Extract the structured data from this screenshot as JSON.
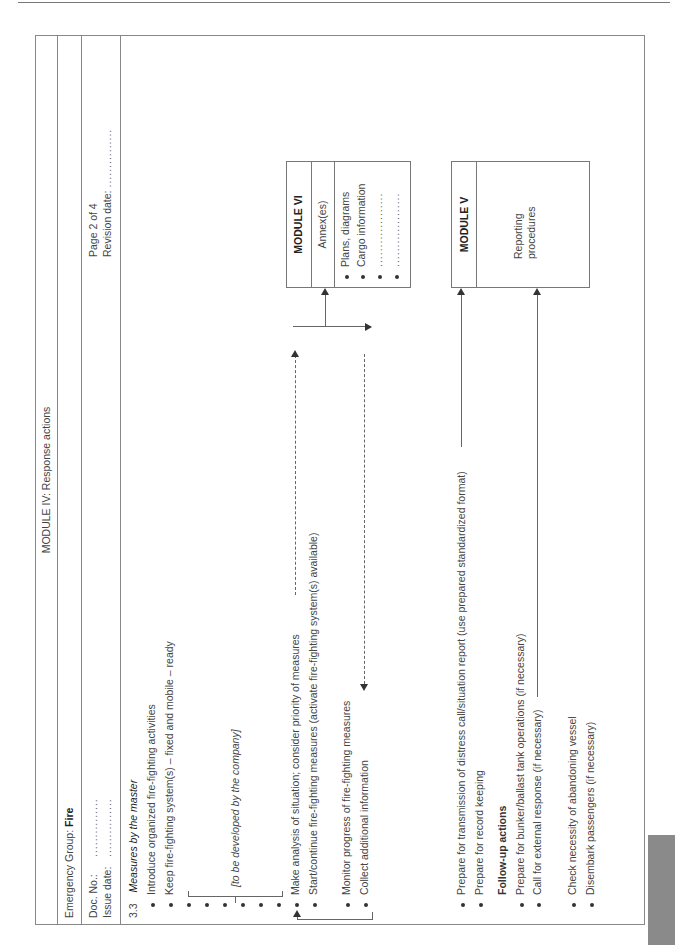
{
  "header": {
    "module_title": "MODULE IV: Response actions",
    "emergency_group_label": "Emergency Group: ",
    "emergency_group_value": "Fire",
    "doc_no_label": "Doc. No.:",
    "doc_no_value": "...............",
    "issue_date_label": "Issue date:",
    "issue_date_value": "...............",
    "page_label": "Page 2 of 4",
    "revision_date_label": "Revision date:",
    "revision_date_value": "..............."
  },
  "section": {
    "number": "3.3",
    "title": "Measures by the master"
  },
  "items": [
    "Introduce organized fire-fighting activities",
    "Keep fire-fighting system(s) – fixed and mobile – ready",
    "",
    "",
    "",
    "",
    "",
    "",
    "Make analysis of situation; consider priority of measures",
    "Start/continue fire-fighting measures (activate fire-fighting system(s) available)",
    "Monitor progress of fire-fighting measures",
    "Collect additional information",
    "Prepare for transmission of distress call/situation report (use prepared standardized format)",
    "Prepare for record keeping"
  ],
  "company_note": "[to be developed by the company]",
  "follow_up": {
    "heading": "Follow-up actions",
    "items": [
      "Prepare for bunker/ballast tank operations (if necessary)",
      "Call for external response (if necessary)",
      "Check necessity of abandoning vessel",
      "Disembark passengers (if necessary)"
    ]
  },
  "module_vi": {
    "title": "MODULE VI",
    "subtitle": "Annex(es)",
    "items": [
      "Plans, diagrams",
      "Cargo information",
      "...................",
      "..................."
    ]
  },
  "module_v": {
    "title": "MODULE V",
    "body_line1": "Reporting",
    "body_line2": "procedures"
  }
}
